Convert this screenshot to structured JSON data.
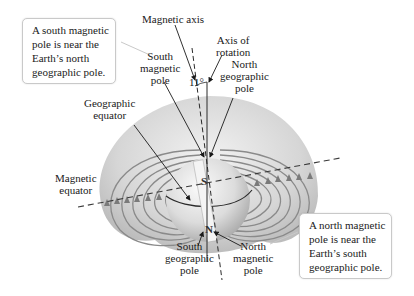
{
  "diagram": {
    "angle_label": "11°",
    "globe_letters": {
      "top": "S",
      "bottom": "N"
    },
    "labels": {
      "magnetic_axis": "Magnetic axis",
      "axis_of_rotation": [
        "Axis of",
        "rotation"
      ],
      "south_magnetic_pole": [
        "South",
        "magnetic",
        "pole"
      ],
      "north_geographic_pole": [
        "North",
        "geographic",
        "pole"
      ],
      "geographic_equator": [
        "Geographic",
        "equator"
      ],
      "magnetic_equator": [
        "Magnetic",
        "equator"
      ],
      "south_geographic_pole": [
        "South",
        "geographic",
        "pole"
      ],
      "north_magnetic_pole": [
        "North",
        "magnetic",
        "pole"
      ]
    },
    "callouts": {
      "top_left": [
        "A south magnetic",
        "pole is near the",
        "Earth’s north",
        "geographic pole."
      ],
      "bottom_right": [
        "A north magnetic",
        "pole is near the",
        "Earth’s south",
        "geographic pole."
      ]
    },
    "colors": {
      "field_lines": "#8a8a8a",
      "cloud": "#cfcfcf",
      "globe": "#e6e6e6",
      "text": "#1a1a1a",
      "bubble_border": "#c9c9c9"
    }
  }
}
